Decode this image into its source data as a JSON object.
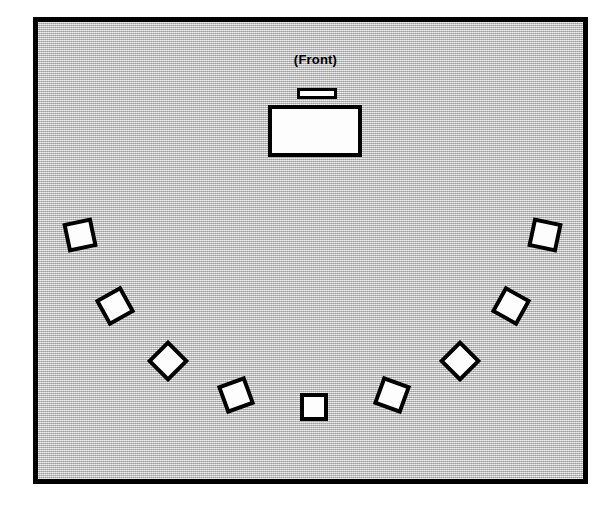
{
  "diagram": {
    "type": "room-layout-floorplan",
    "title_label": "(Front)",
    "canvas": {
      "width": 608,
      "height": 506,
      "background": "#ffffff"
    },
    "room": {
      "name": "meeting-room",
      "x": 33,
      "y": 17,
      "width": 555,
      "height": 467,
      "fill_color": "#c4c4c4",
      "border_color": "#000000",
      "border_width": 5,
      "fill_style": "halftone-gray-screen"
    },
    "front_label": {
      "text": "(Front)",
      "position": "top-center",
      "color": "#000000"
    },
    "furniture": [
      {
        "id": "lectern",
        "label": "podium-lectern",
        "shape": "rectangle",
        "x": 259,
        "y": 66,
        "width": 40,
        "height": 11,
        "rotation": 0,
        "fill": "#fdfdfd",
        "stroke": "#000000"
      },
      {
        "id": "instructor-desk",
        "label": "instructor-desk",
        "shape": "rectangle",
        "x": 230,
        "y": 83,
        "width": 94,
        "height": 52,
        "rotation": 0,
        "fill": "#fdfdfd",
        "stroke": "#000000"
      }
    ],
    "chairs": {
      "count": 9,
      "arrangement": "semicircle-arc-u-shape",
      "fill": "#fdfdfd",
      "stroke": "#000000",
      "items": [
        {
          "id": "chair-1",
          "label": "chair-far-left",
          "x": 27,
          "y": 198,
          "size": 30,
          "rotation": -12
        },
        {
          "id": "chair-2",
          "label": "chair-left-upper",
          "x": 62,
          "y": 269,
          "size": 30,
          "rotation": -29
        },
        {
          "id": "chair-3",
          "label": "chair-left-lower",
          "x": 115,
          "y": 324,
          "size": 30,
          "rotation": -45
        },
        {
          "id": "chair-4",
          "label": "chair-left-inner",
          "x": 183,
          "y": 358,
          "size": 30,
          "rotation": -20
        },
        {
          "id": "chair-5",
          "label": "chair-center",
          "x": 262,
          "y": 371,
          "size": 28,
          "rotation": 0
        },
        {
          "id": "chair-6",
          "label": "chair-right-inner",
          "x": 339,
          "y": 358,
          "size": 30,
          "rotation": 20
        },
        {
          "id": "chair-7",
          "label": "chair-right-lower",
          "x": 407,
          "y": 324,
          "size": 30,
          "rotation": 45
        },
        {
          "id": "chair-8",
          "label": "chair-right-upper",
          "x": 458,
          "y": 269,
          "size": 30,
          "rotation": 29
        },
        {
          "id": "chair-9",
          "label": "chair-far-right",
          "x": 492,
          "y": 198,
          "size": 30,
          "rotation": 12
        }
      ]
    }
  }
}
